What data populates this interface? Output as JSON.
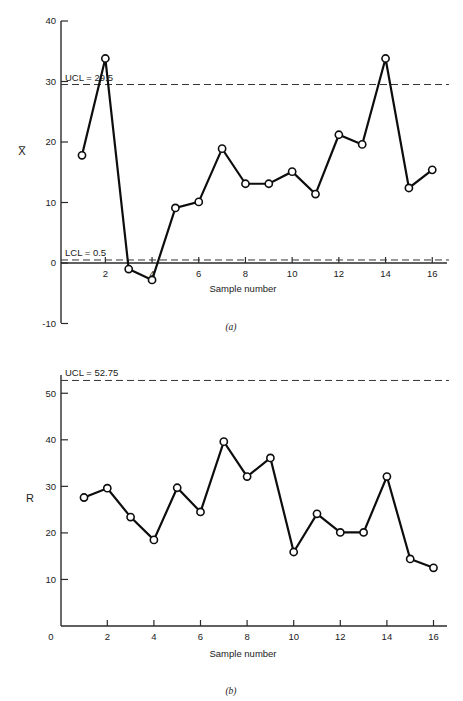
{
  "figure": {
    "caption_a": "(a)",
    "caption_b": "(b)"
  },
  "chart_data": [
    {
      "id": "xbar-chart",
      "type": "line",
      "title": "",
      "panel_label": "(a)",
      "xlabel": "Sample number",
      "ylabel": "X̅",
      "ylabel_plain": "X-bar",
      "x": [
        1,
        2,
        3,
        4,
        5,
        6,
        7,
        8,
        9,
        10,
        11,
        12,
        13,
        14,
        15,
        16
      ],
      "values": [
        17.8,
        33.8,
        -1.0,
        -2.8,
        9.1,
        10.1,
        18.9,
        13.1,
        13.1,
        15.1,
        11.4,
        21.2,
        19.6,
        33.8,
        12.4,
        15.4
      ],
      "xlim": [
        0,
        16.6
      ],
      "ylim": [
        -10,
        40
      ],
      "xticks": [
        2,
        4,
        6,
        8,
        10,
        12,
        14,
        16
      ],
      "xticklabels": [
        "2",
        "4",
        "6",
        "8",
        "10",
        "12",
        "14",
        "16"
      ],
      "yticks": [
        -10,
        0,
        10,
        20,
        30,
        40
      ],
      "yticklabels": [
        "-10",
        "0",
        "10",
        "20",
        "30",
        "40"
      ],
      "grid": false,
      "legend": "none",
      "control_limits": [
        {
          "name": "UCL",
          "label": "UCL = 29.5",
          "value": 29.5,
          "style": "dashed"
        },
        {
          "name": "LCL",
          "label": "LCL = 0.5",
          "value": 0.5,
          "style": "dashed"
        }
      ],
      "marker": "open-circle",
      "line_color": "#0d0d0d"
    },
    {
      "id": "range-chart",
      "type": "line",
      "title": "",
      "panel_label": "(b)",
      "xlabel": "Sample number",
      "ylabel": "R",
      "x": [
        1,
        2,
        3,
        4,
        5,
        6,
        7,
        8,
        9,
        10,
        11,
        12,
        13,
        14,
        15,
        16
      ],
      "values": [
        27.6,
        29.6,
        23.4,
        18.5,
        29.7,
        24.5,
        39.6,
        32.1,
        36.1,
        15.9,
        24.1,
        20.1,
        20.1,
        32.1,
        14.4,
        12.5
      ],
      "xlim": [
        0,
        16.6
      ],
      "ylim": [
        0,
        55
      ],
      "xticks": [
        0,
        2,
        4,
        6,
        8,
        10,
        12,
        14,
        16
      ],
      "xticklabels": [
        "0",
        "2",
        "4",
        "6",
        "8",
        "10",
        "12",
        "14",
        "16"
      ],
      "yticks": [
        10,
        20,
        30,
        40,
        50
      ],
      "yticklabels": [
        "10",
        "20",
        "30",
        "40",
        "50"
      ],
      "grid": false,
      "legend": "none",
      "control_limits": [
        {
          "name": "UCL",
          "label": "UCL = 52.75",
          "value": 52.75,
          "style": "dashed"
        }
      ],
      "marker": "open-circle",
      "line_color": "#0d0d0d"
    }
  ]
}
